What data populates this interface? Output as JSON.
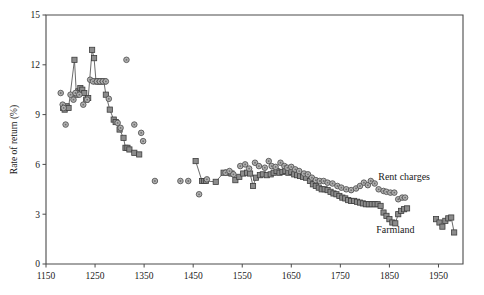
{
  "chart_data": {
    "type": "scatter",
    "title": "",
    "subtitle": "",
    "xlabel": "",
    "ylabel": "Rate of return (%)",
    "xlim": [
      1150,
      2000
    ],
    "ylim": [
      0,
      15
    ],
    "xticks": [
      1150,
      1250,
      1350,
      1450,
      1550,
      1650,
      1750,
      1850,
      1950
    ],
    "yticks": [
      0,
      3,
      6,
      9,
      12,
      15
    ],
    "xtick_labels": [
      "1150",
      "1250",
      "1350",
      "1450",
      "1550",
      "1650",
      "1750",
      "1850",
      "1950"
    ],
    "ytick_labels": [
      "0",
      "3",
      "6",
      "9",
      "12",
      "15"
    ],
    "grid": false,
    "legend_position": "inline-annotation",
    "annotations": [
      {
        "text": "Rent charges",
        "x": 1880,
        "y": 5.05
      },
      {
        "text": "Farmland",
        "x": 1862,
        "y": 1.85
      }
    ],
    "series": [
      {
        "name": "Farmland",
        "marker": "square",
        "color": "#8c8c8c",
        "edge_color": "#3d3d3d",
        "connected": true,
        "points": [
          [
            1185,
            9.4
          ],
          [
            1188,
            9.3
          ],
          [
            1192,
            9.5
          ],
          [
            1196,
            9.4
          ],
          [
            1208,
            12.3
          ],
          [
            1212,
            10.2
          ],
          [
            1216,
            10.4
          ],
          [
            1220,
            10.6
          ],
          [
            1224,
            10.5
          ],
          [
            1228,
            10.3
          ],
          [
            1232,
            9.9
          ],
          [
            1236,
            10.0
          ],
          [
            1244,
            12.9
          ],
          [
            1248,
            12.4
          ],
          [
            1252,
            11.0
          ],
          [
            1256,
            11.0
          ],
          [
            1260,
            11.0
          ],
          [
            1264,
            11.0
          ],
          [
            1268,
            11.0
          ],
          [
            1272,
            10.2
          ],
          [
            1280,
            9.3
          ],
          [
            1288,
            8.7
          ],
          [
            1292,
            8.55
          ],
          [
            1300,
            8.1
          ],
          [
            1308,
            7.6
          ],
          [
            1312,
            7.0
          ],
          [
            1316,
            7.0
          ],
          [
            1320,
            6.9
          ],
          [
            1330,
            6.7
          ],
          [
            1340,
            6.6
          ],
          [
            1455,
            6.2
          ],
          [
            1468,
            5.0
          ],
          [
            1472,
            5.0
          ],
          [
            1476,
            5.0
          ],
          [
            1496,
            4.95
          ],
          [
            1512,
            5.5
          ],
          [
            1520,
            5.5
          ],
          [
            1528,
            5.45
          ],
          [
            1536,
            5.05
          ],
          [
            1544,
            5.25
          ],
          [
            1552,
            5.45
          ],
          [
            1560,
            5.5
          ],
          [
            1566,
            5.45
          ],
          [
            1572,
            4.7
          ],
          [
            1578,
            5.2
          ],
          [
            1586,
            5.35
          ],
          [
            1592,
            5.4
          ],
          [
            1600,
            5.35
          ],
          [
            1608,
            5.4
          ],
          [
            1614,
            5.5
          ],
          [
            1620,
            5.6
          ],
          [
            1626,
            5.5
          ],
          [
            1632,
            5.55
          ],
          [
            1638,
            5.6
          ],
          [
            1644,
            5.5
          ],
          [
            1650,
            5.55
          ],
          [
            1656,
            5.4
          ],
          [
            1662,
            5.35
          ],
          [
            1668,
            5.3
          ],
          [
            1674,
            5.25
          ],
          [
            1680,
            5.2
          ],
          [
            1688,
            5.0
          ],
          [
            1694,
            4.8
          ],
          [
            1700,
            4.7
          ],
          [
            1706,
            4.6
          ],
          [
            1712,
            4.5
          ],
          [
            1718,
            4.5
          ],
          [
            1724,
            4.45
          ],
          [
            1730,
            4.35
          ],
          [
            1736,
            4.25
          ],
          [
            1742,
            4.2
          ],
          [
            1748,
            4.1
          ],
          [
            1754,
            4.0
          ],
          [
            1760,
            3.95
          ],
          [
            1766,
            3.85
          ],
          [
            1772,
            3.8
          ],
          [
            1778,
            3.8
          ],
          [
            1784,
            3.75
          ],
          [
            1790,
            3.7
          ],
          [
            1796,
            3.65
          ],
          [
            1802,
            3.6
          ],
          [
            1808,
            3.6
          ],
          [
            1814,
            3.6
          ],
          [
            1820,
            3.6
          ],
          [
            1826,
            3.6
          ],
          [
            1832,
            3.5
          ],
          [
            1838,
            3.1
          ],
          [
            1844,
            2.9
          ],
          [
            1850,
            2.7
          ],
          [
            1856,
            2.5
          ],
          [
            1862,
            2.45
          ],
          [
            1868,
            3.0
          ],
          [
            1874,
            3.2
          ],
          [
            1880,
            3.3
          ],
          [
            1886,
            3.35
          ],
          [
            1945,
            2.7
          ],
          [
            1952,
            2.5
          ],
          [
            1958,
            2.25
          ],
          [
            1964,
            2.6
          ],
          [
            1970,
            2.75
          ],
          [
            1976,
            2.8
          ],
          [
            1982,
            1.9
          ]
        ]
      },
      {
        "name": "Rent charges",
        "marker": "circle",
        "color": "#b0b0b0",
        "edge_color": "#4a4a4a",
        "connected": false,
        "points": [
          [
            1180,
            10.3
          ],
          [
            1184,
            9.6
          ],
          [
            1186,
            9.4
          ],
          [
            1190,
            8.4
          ],
          [
            1200,
            10.2
          ],
          [
            1206,
            9.9
          ],
          [
            1210,
            10.3
          ],
          [
            1218,
            10.2
          ],
          [
            1226,
            9.6
          ],
          [
            1234,
            9.9
          ],
          [
            1240,
            11.1
          ],
          [
            1246,
            11.0
          ],
          [
            1254,
            11.0
          ],
          [
            1260,
            11.0
          ],
          [
            1266,
            11.0
          ],
          [
            1272,
            11.0
          ],
          [
            1278,
            9.95
          ],
          [
            1296,
            8.5
          ],
          [
            1302,
            8.2
          ],
          [
            1314,
            12.3
          ],
          [
            1330,
            8.4
          ],
          [
            1344,
            7.9
          ],
          [
            1348,
            7.4
          ],
          [
            1372,
            5.0
          ],
          [
            1424,
            5.0
          ],
          [
            1440,
            5.0
          ],
          [
            1478,
            5.1
          ],
          [
            1462,
            4.2
          ],
          [
            1516,
            5.5
          ],
          [
            1524,
            5.6
          ],
          [
            1532,
            5.4
          ],
          [
            1546,
            5.9
          ],
          [
            1556,
            6.0
          ],
          [
            1564,
            5.75
          ],
          [
            1576,
            6.1
          ],
          [
            1584,
            5.9
          ],
          [
            1596,
            5.8
          ],
          [
            1604,
            6.2
          ],
          [
            1610,
            5.9
          ],
          [
            1618,
            5.85
          ],
          [
            1628,
            6.1
          ],
          [
            1636,
            5.9
          ],
          [
            1642,
            5.8
          ],
          [
            1650,
            5.85
          ],
          [
            1658,
            5.7
          ],
          [
            1666,
            5.6
          ],
          [
            1676,
            5.45
          ],
          [
            1684,
            5.4
          ],
          [
            1692,
            5.2
          ],
          [
            1700,
            5.05
          ],
          [
            1708,
            5.0
          ],
          [
            1716,
            5.0
          ],
          [
            1724,
            4.9
          ],
          [
            1734,
            4.85
          ],
          [
            1744,
            4.7
          ],
          [
            1752,
            4.6
          ],
          [
            1762,
            4.5
          ],
          [
            1772,
            4.45
          ],
          [
            1782,
            4.55
          ],
          [
            1790,
            4.7
          ],
          [
            1798,
            4.9
          ],
          [
            1806,
            4.75
          ],
          [
            1812,
            5.0
          ],
          [
            1820,
            4.85
          ],
          [
            1828,
            4.5
          ],
          [
            1838,
            4.4
          ],
          [
            1844,
            4.35
          ],
          [
            1852,
            4.3
          ],
          [
            1860,
            4.3
          ],
          [
            1868,
            3.9
          ],
          [
            1876,
            4.0
          ],
          [
            1882,
            4.0
          ]
        ]
      }
    ]
  }
}
